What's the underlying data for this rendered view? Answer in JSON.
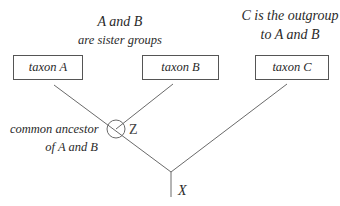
{
  "annotations": {
    "sister_line1": "A and B",
    "sister_line2": "are sister groups",
    "outgroup_line1": "C is the outgroup",
    "outgroup_line2": "to A and B",
    "ancestor_line1": "common ancestor",
    "ancestor_line2": "of A and B"
  },
  "taxa": [
    {
      "label": "taxon A"
    },
    {
      "label": "taxon B"
    },
    {
      "label": "taxon C"
    }
  ],
  "nodes": {
    "z_label": "Z",
    "x_label": "X"
  },
  "colors": {
    "line": "#6a6a6a",
    "text": "#2a2a2a",
    "box_border": "#555555"
  }
}
